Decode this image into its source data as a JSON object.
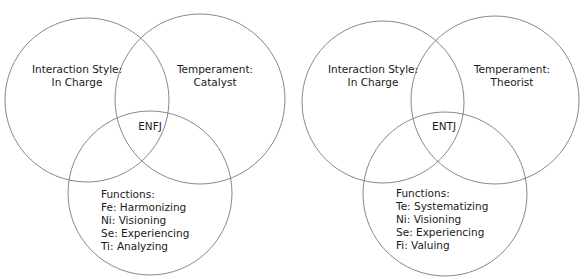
{
  "title": "",
  "diagrams": [
    {
      "type_code": "ENFJ",
      "interaction_style": {
        "heading": "Interaction Style:",
        "value": "In Charge"
      },
      "temperament": {
        "heading": "Temperament:",
        "value": "Catalyst"
      },
      "functions": {
        "heading": "Functions:",
        "items": [
          "Fe: Harmonizing",
          "Ni: Visioning",
          "Se: Experiencing",
          "Ti: Analyzing"
        ]
      }
    },
    {
      "type_code": "ENTJ",
      "interaction_style": {
        "heading": "Interaction Style:",
        "value": "In Charge"
      },
      "temperament": {
        "heading": "Temperament:",
        "value": "Theorist"
      },
      "functions": {
        "heading": "Functions:",
        "items": [
          "Te: Systematizing",
          "Ni: Visioning",
          "Se: Experiencing",
          "Fi: Valuing"
        ]
      }
    }
  ],
  "colors": {
    "stroke": "#7a7a7a",
    "text": "#1a1a1a",
    "background": "#ffffff"
  }
}
